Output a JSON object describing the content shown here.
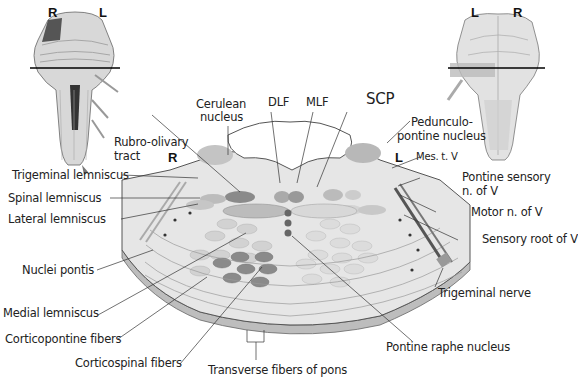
{
  "diagram": {
    "colors": {
      "background": "#ffffff",
      "tissue": "#e6e6e6",
      "tissue_dark": "#cfcfcf",
      "edge": "#555555",
      "tract_dark": "#777777",
      "tract_mid": "#9a9a9a",
      "tract_light": "#cfcfcf",
      "ventricle": "#ffffff",
      "leader": "#333333",
      "text": "#222222"
    },
    "orientation": {
      "left_thumbnail": {
        "left": "R",
        "right": "L"
      },
      "right_thumbnail": {
        "left": "L",
        "right": "R"
      },
      "section": {
        "left": "R",
        "right": "L"
      }
    },
    "labels": {
      "dlf": "DLF",
      "mlf": "MLF",
      "scp": "SCP",
      "cerulean_1": "Cerulean",
      "cerulean_2": "nucleus",
      "pedunculo_1": "Pedunculo-",
      "pedunculo_2": "pontine nucleus",
      "rubro_1": "Rubro-olivary",
      "rubro_2": "tract",
      "mes_t_v": "Mes. t. V",
      "pontine_sensory_1": "Pontine sensory",
      "pontine_sensory_2": "n. of V",
      "motor_v": "Motor n. of V",
      "sensory_root_v": "Sensory root of V",
      "trigeminal_nerve": "Trigeminal nerve",
      "trigeminal_lemniscus": "Trigeminal lemniscus",
      "spinal_lemniscus": "Spinal lemniscus",
      "lateral_lemniscus": "Lateral lemniscus",
      "nuclei_pontis": "Nuclei pontis",
      "medial_lemniscus": "Medial lemniscus",
      "corticopontine": "Corticopontine fibers",
      "corticospinal": "Corticospinal fibers",
      "transverse": "Transverse fibers of pons",
      "pontine_raphe": "Pontine raphe nucleus"
    }
  }
}
